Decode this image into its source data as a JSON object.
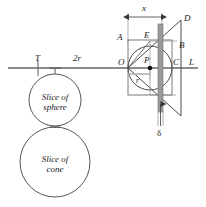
{
  "figure": {
    "stroke_color": "#3a3a3a",
    "axis_color": "#555555",
    "slab_fill": "#9a9a9a",
    "slab_edge": "#6e6e6e",
    "background": "#ffffff"
  },
  "labels": {
    "fulcrum": "T",
    "lever_length": "2r",
    "origin": "O",
    "point_A": "A",
    "point_B": "B",
    "point_C": "C",
    "point_D": "D",
    "point_E": "E",
    "point_P": "P",
    "line_L": "L",
    "radius": "r",
    "distance_x": "x",
    "thickness": "δ",
    "slice_sphere_line1": "Slice of",
    "slice_sphere_line2": "sphere",
    "slice_cone_line1": "Slice of",
    "slice_cone_line2": "cone"
  },
  "geometry": {
    "lever_line_y": 68,
    "lever_line_x_start": 8,
    "lever_line_x_end": 198,
    "fulcrum_x": 38,
    "square_left": 128,
    "square_right": 172,
    "square_top": 40,
    "square_bottom": 95,
    "circle_center_x": 150,
    "circle_center_y": 68,
    "circle_radius": 22,
    "slab_left": 158,
    "slab_right": 163,
    "apex_D_x": 181,
    "apex_D_y": 20,
    "sphere_circle": {
      "cx": 55,
      "cy": 100,
      "r": 26
    },
    "cone_circle": {
      "cx": 55,
      "cy": 162,
      "r": 35
    }
  }
}
